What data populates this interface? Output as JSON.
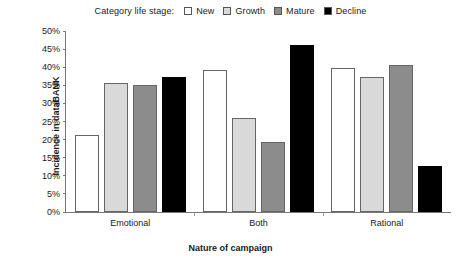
{
  "chart_data": {
    "type": "bar",
    "title": "",
    "subtitle": "",
    "categories": [
      "Emotional",
      "Both",
      "Rational"
    ],
    "series": [
      {
        "name": "New",
        "color": "#ffffff",
        "values": [
          21.4,
          39.3,
          39.9
        ]
      },
      {
        "name": "Growth",
        "color": "#d9d9d9",
        "values": [
          35.7,
          26.0,
          37.2
        ]
      },
      {
        "name": "Mature",
        "color": "#8c8c8c",
        "values": [
          35.0,
          19.3,
          40.6
        ]
      },
      {
        "name": "Decline",
        "color": "#000000",
        "values": [
          37.4,
          46.2,
          12.7
        ]
      }
    ],
    "xlabel": "Nature of campaign",
    "ylabel": "Incidence in dataBANK",
    "ylim": [
      0,
      50
    ],
    "ytick_step": 5,
    "ytick_labels": [
      "50%",
      "45%",
      "40%",
      "35%",
      "30%",
      "25%",
      "20%",
      "15%",
      "10%",
      "5%",
      "0%"
    ],
    "ytick_values": [
      50,
      45,
      40,
      35,
      30,
      25,
      20,
      15,
      10,
      5,
      0
    ],
    "grid": false,
    "legend_position": "top",
    "legend_title": "Category life stage:",
    "value_suffix": "%"
  },
  "legend": {
    "title": "Category life stage:",
    "entries": [
      {
        "label": "New",
        "swatch": "legend-swatch-new"
      },
      {
        "label": "Growth",
        "swatch": "legend-swatch-growth"
      },
      {
        "label": "Mature",
        "swatch": "legend-swatch-mature"
      },
      {
        "label": "Decline",
        "swatch": "legend-swatch-decline"
      }
    ]
  },
  "axes": {
    "x_title": "Nature of campaign",
    "y_title": "Incidence in dataBANK"
  },
  "colors": {
    "new": "#ffffff",
    "growth": "#d9d9d9",
    "mature": "#8c8c8c",
    "decline": "#000000",
    "axis": "#777777",
    "bar_outline": "#666666",
    "text": "#1a1a1a",
    "background": "#ffffff"
  }
}
